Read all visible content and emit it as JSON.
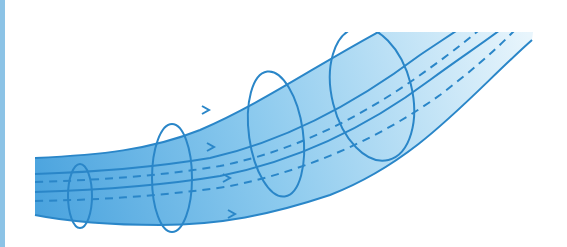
{
  "diagram": {
    "colors": {
      "stroke": "#2a86c8",
      "fill_dark": "#4aa3de",
      "fill_light": "#e8f5fc",
      "left_border": "#8cc3e6",
      "background": "#ffffff"
    },
    "cross_sections": [
      {
        "cx": 80,
        "cy": 196,
        "rx": 12,
        "ry": 32
      },
      {
        "cx": 172,
        "cy": 178,
        "rx": 20,
        "ry": 54
      },
      {
        "cx": 276,
        "cy": 134,
        "rx": 27,
        "ry": 63
      },
      {
        "cx": 372,
        "cy": 94,
        "rx": 40,
        "ry": 68
      }
    ],
    "streamlines_solid": 2,
    "streamlines_dashed": 2,
    "flow_arrows": 4,
    "label": ""
  }
}
